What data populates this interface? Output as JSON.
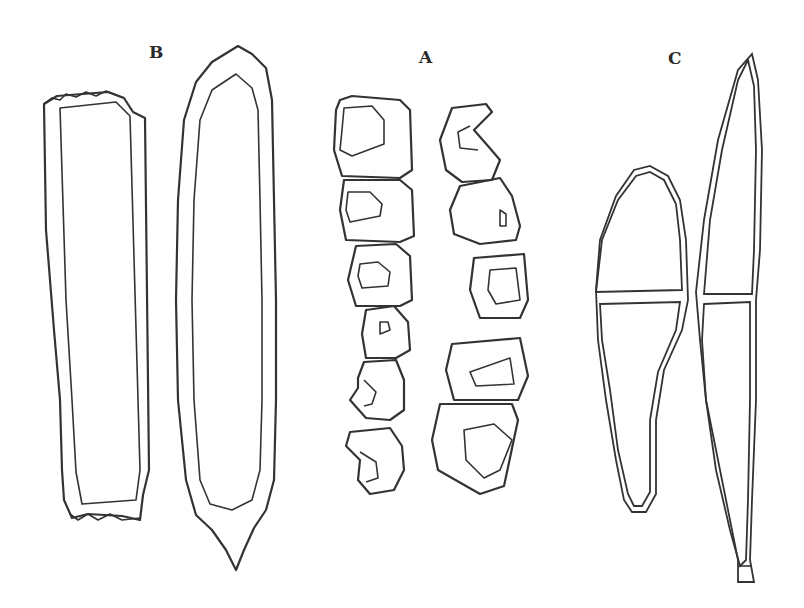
{
  "figure": {
    "labels": {
      "b": "B",
      "a": "A",
      "c": "C"
    },
    "panels": [
      {
        "id": "B",
        "description": "Two elongated stippled spores: a rectangular dotted spore and a pointed fusiform spore with densely stippled interior"
      },
      {
        "id": "A",
        "description": "Two chains of rounded segmented cells, each cell with an inner lumen (some crescent-shaped)"
      },
      {
        "id": "C",
        "description": "Two double-walled two-celled spores divided by a septum; left club-shaped, right long tapering with stalk"
      }
    ],
    "colors": {
      "background": "#ffffff",
      "ink": "#333333"
    }
  }
}
